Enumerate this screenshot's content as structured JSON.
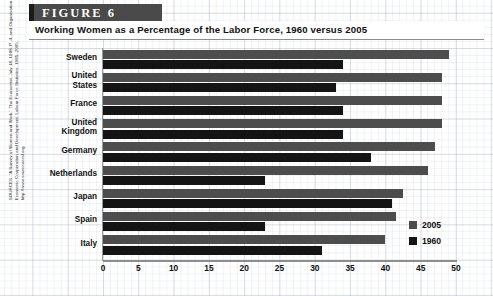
{
  "figure": {
    "banner_label": "FIGURE 6",
    "title": "Working Women as a Percentage of the Labor Force, 1960 versus 2005",
    "source_note": "SOURCES: \"A Survey of Women and Work,\" The Economist, July 18, 1998, P. 4, and Organisation for Economic Cooperation and Development, Labour Force Statistics, 1985–2005, http://www.sourceoecd.org"
  },
  "legend": {
    "position": "inside-bottom-right",
    "items": [
      {
        "label": "2005",
        "color": "#4d4d4d"
      },
      {
        "label": "1960",
        "color": "#141414"
      }
    ]
  },
  "axis": {
    "x_ticks": [
      "0",
      "5",
      "10",
      "15",
      "20",
      "25",
      "30",
      "35",
      "40",
      "45",
      "50"
    ],
    "x_min": 0,
    "x_max": 50,
    "x_step": 5
  },
  "chart_data": {
    "type": "bar",
    "orientation": "horizontal",
    "title": "Working Women as a Percentage of the Labor Force, 1960 versus 2005",
    "xlabel": "",
    "ylabel": "",
    "xlim": [
      0,
      50
    ],
    "grid": true,
    "categories": [
      "Sweden",
      "United States",
      "France",
      "United Kingdom",
      "Germany",
      "Netherlands",
      "Japan",
      "Spain",
      "Italy"
    ],
    "series": [
      {
        "name": "2005",
        "color": "#4d4d4d",
        "values": [
          49,
          48,
          48,
          48,
          47,
          46,
          42.5,
          41.5,
          40
        ]
      },
      {
        "name": "1960",
        "color": "#141414",
        "values": [
          34,
          33,
          34,
          34,
          38,
          23,
          41,
          23,
          31
        ]
      }
    ]
  },
  "rows": [
    {
      "label_line1": "Sweden",
      "label_line2": "",
      "v2005": 49,
      "v1960": 34
    },
    {
      "label_line1": "United",
      "label_line2": "States",
      "v2005": 48,
      "v1960": 33
    },
    {
      "label_line1": "France",
      "label_line2": "",
      "v2005": 48,
      "v1960": 34
    },
    {
      "label_line1": "United",
      "label_line2": "Kingdom",
      "v2005": 48,
      "v1960": 34
    },
    {
      "label_line1": "Germany",
      "label_line2": "",
      "v2005": 47,
      "v1960": 38
    },
    {
      "label_line1": "Netherlands",
      "label_line2": "",
      "v2005": 46,
      "v1960": 23
    },
    {
      "label_line1": "Japan",
      "label_line2": "",
      "v2005": 42.5,
      "v1960": 41
    },
    {
      "label_line1": "Spain",
      "label_line2": "",
      "v2005": 41.5,
      "v1960": 23
    },
    {
      "label_line1": "Italy",
      "label_line2": "",
      "v2005": 40,
      "v1960": 31
    }
  ]
}
